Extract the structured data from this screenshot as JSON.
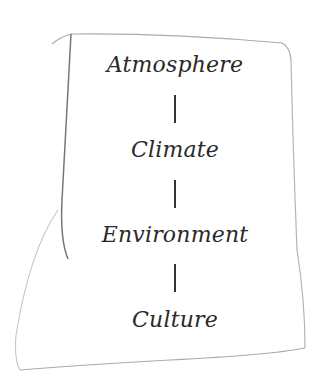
{
  "diagram": {
    "type": "vertical-chain",
    "nodes": [
      {
        "label": "Atmosphere"
      },
      {
        "label": "Climate"
      },
      {
        "label": "Environment"
      },
      {
        "label": "Culture"
      }
    ],
    "edges": [
      {
        "from": "Atmosphere",
        "to": "Climate"
      },
      {
        "from": "Climate",
        "to": "Environment"
      },
      {
        "from": "Environment",
        "to": "Culture"
      }
    ],
    "style": {
      "frame": "hand-drawn sketch outline",
      "text_color": "#2a2a2a",
      "stroke_color": "#888888"
    }
  }
}
